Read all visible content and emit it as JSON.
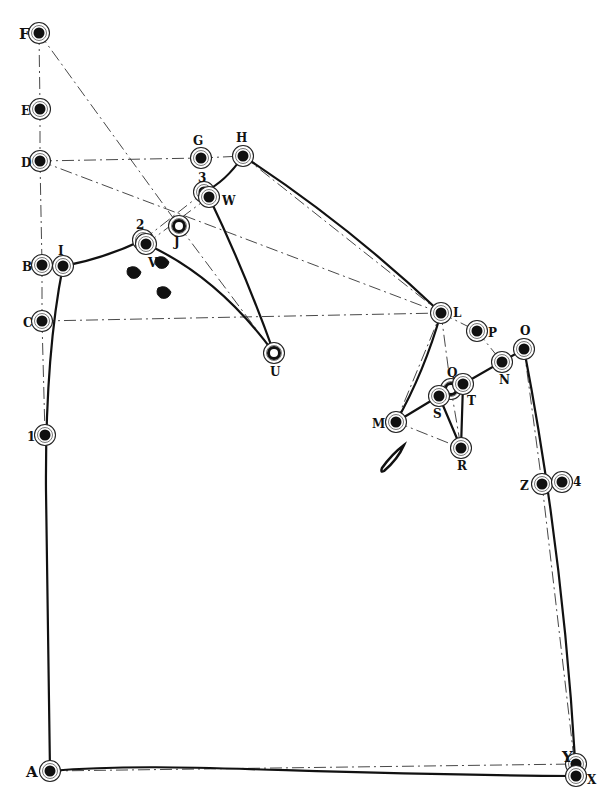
{
  "points": [
    {
      "id": "F",
      "label": "F",
      "kind": "dot"
    },
    {
      "id": "E",
      "label": "E",
      "kind": "dot"
    },
    {
      "id": "D",
      "label": "D",
      "kind": "dot"
    },
    {
      "id": "G",
      "label": "G",
      "kind": "dot"
    },
    {
      "id": "H",
      "label": "H",
      "kind": "dot"
    },
    {
      "id": "3",
      "label": "3",
      "kind": "dot"
    },
    {
      "id": "W",
      "label": "W",
      "kind": "dot"
    },
    {
      "id": "J",
      "label": "J",
      "kind": "ring"
    },
    {
      "id": "2",
      "label": "2",
      "kind": "dot"
    },
    {
      "id": "V",
      "label": "V",
      "kind": "dot"
    },
    {
      "id": "B",
      "label": "B",
      "kind": "dot"
    },
    {
      "id": "I",
      "label": "I",
      "kind": "dot"
    },
    {
      "id": "C",
      "label": "C",
      "kind": "dot"
    },
    {
      "id": "U",
      "label": "U",
      "kind": "ring"
    },
    {
      "id": "1",
      "label": "1",
      "kind": "dot"
    },
    {
      "id": "L",
      "label": "L",
      "kind": "dot"
    },
    {
      "id": "P",
      "label": "P",
      "kind": "dot"
    },
    {
      "id": "O",
      "label": "O",
      "kind": "dot"
    },
    {
      "id": "N",
      "label": "N",
      "kind": "dot"
    },
    {
      "id": "Q",
      "label": "Q",
      "kind": "ring"
    },
    {
      "id": "S",
      "label": "S",
      "kind": "dot"
    },
    {
      "id": "T",
      "label": "T",
      "kind": "dot"
    },
    {
      "id": "M",
      "label": "M",
      "kind": "dot"
    },
    {
      "id": "R",
      "label": "R",
      "kind": "dot"
    },
    {
      "id": "Z",
      "label": "Z",
      "kind": "dot"
    },
    {
      "id": "4",
      "label": "4",
      "kind": "dot"
    },
    {
      "id": "A",
      "label": "A",
      "kind": "dot"
    },
    {
      "id": "Y",
      "label": "Y",
      "kind": "dot"
    },
    {
      "id": "X",
      "label": "X",
      "kind": "dot"
    }
  ],
  "construction_lines": [
    [
      "F",
      "E"
    ],
    [
      "E",
      "D"
    ],
    [
      "D",
      "B"
    ],
    [
      "B",
      "C"
    ],
    [
      "C",
      "1"
    ],
    [
      "D",
      "G"
    ],
    [
      "G",
      "H"
    ],
    [
      "F",
      "J"
    ],
    [
      "J",
      "U"
    ],
    [
      "D",
      "L"
    ],
    [
      "C",
      "L"
    ],
    [
      "2",
      "3"
    ],
    [
      "V",
      "W"
    ],
    [
      "H",
      "L"
    ],
    [
      "L",
      "P"
    ],
    [
      "P",
      "N"
    ],
    [
      "L",
      "Q"
    ],
    [
      "M",
      "R"
    ],
    [
      "Q",
      "R"
    ],
    [
      "O",
      "Z"
    ],
    [
      "Z",
      "X"
    ],
    [
      "A",
      "Y"
    ],
    [
      "B",
      "I"
    ],
    [
      "M",
      "L"
    ]
  ],
  "outline_curves": [
    {
      "from": "I",
      "to": "A",
      "name": "front-edge"
    },
    {
      "from": "I",
      "to": "2",
      "name": "neck-curve"
    },
    {
      "from": "V",
      "to": "U",
      "name": "dart-left"
    },
    {
      "from": "W",
      "to": "U",
      "name": "dart-right"
    },
    {
      "from": "3",
      "to": "H",
      "name": "shoulder-point"
    },
    {
      "from": "H",
      "to": "L",
      "name": "shoulder-seam"
    },
    {
      "from": "L",
      "to": "M",
      "name": "armhole"
    },
    {
      "from": "M",
      "to": "S",
      "name": "side-line-1"
    },
    {
      "from": "T",
      "to": "O",
      "name": "side-line-2"
    },
    {
      "from": "S",
      "to": "R",
      "name": "underarm-dart-left"
    },
    {
      "from": "T",
      "to": "R",
      "name": "underarm-dart-right"
    },
    {
      "from": "O",
      "to": "X",
      "name": "back-seam"
    },
    {
      "from": "A",
      "to": "X",
      "name": "hem"
    }
  ],
  "marks": [
    {
      "name": "tack-mark-1"
    },
    {
      "name": "tack-mark-2"
    },
    {
      "name": "tack-mark-3"
    },
    {
      "name": "loop-mark"
    }
  ]
}
